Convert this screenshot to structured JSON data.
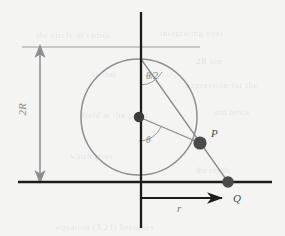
{
  "figure": {
    "background_color": "#f4f4f2",
    "stroke_dark": "#1c1c1c",
    "stroke_gray": "#8e8e92",
    "dot_fill": "#3b3b3b",
    "point_fill": "#4a4a4a"
  },
  "labels": {
    "diameter": "2R",
    "angle_half": "θ/2",
    "angle": "θ",
    "point_p": "P",
    "point_q": "Q",
    "distance_r": "r"
  },
  "geometry": {
    "canvas": {
      "width": 285,
      "height": 236
    },
    "vertical_axis": {
      "x": 141,
      "y1": 12,
      "y2": 228,
      "color": "#1c1c1c",
      "width": 2.2
    },
    "baseline": {
      "y": 182,
      "x1": 18,
      "x2": 272,
      "color": "#1c1c1c",
      "width": 2.2
    },
    "tangent_top": {
      "y": 47,
      "x1": 22,
      "x2": 200,
      "color": "#9a9a9e",
      "width": 1.1
    },
    "circle": {
      "cx": 139,
      "cy": 117,
      "r": 58,
      "color": "#8e8e92",
      "width": 1.4
    },
    "center_dot": {
      "cx": 139,
      "cy": 117,
      "r": 5.2
    },
    "point_p": {
      "cx": 200,
      "cy": 143,
      "r": 6.6
    },
    "point_q": {
      "cx": 228,
      "cy": 182,
      "r": 5.8
    },
    "circle_top": {
      "x": 141,
      "y": 59
    },
    "chord_top_to_q": {
      "x1": 141,
      "y1": 59,
      "x2": 228,
      "y2": 182
    },
    "radius_to_p": {
      "x1": 139,
      "y1": 117,
      "x2": 200,
      "y2": 143
    },
    "dimension_line": {
      "x": 40,
      "y_top": 47,
      "y_bottom": 182,
      "color": "#8e8e92"
    },
    "r_arrow": {
      "y": 198,
      "x1": 141,
      "x2": 226,
      "color": "#1c1c1c"
    },
    "angle_arc_half": {
      "cx": 141,
      "cy": 59,
      "r": 26,
      "from_deg": 90,
      "to_deg": 55
    },
    "angle_arc_theta": {
      "cx": 139,
      "cy": 117,
      "r": 24,
      "from_deg": 90,
      "to_deg": 23
    }
  },
  "label_positions": {
    "diameter": {
      "left": 18,
      "top": 106
    },
    "angle_half": {
      "left": 128,
      "top": 72
    },
    "angle": {
      "left": 144,
      "top": 134
    },
    "point_p": {
      "left": 210,
      "top": 128
    },
    "point_q": {
      "left": 232,
      "top": 193
    },
    "distance_r": {
      "left": 176,
      "top": 202
    }
  },
  "bleed_text": [
    {
      "text": "the circle of radius",
      "left": 36,
      "top": 30,
      "size": 9
    },
    {
      "text": "integrating over",
      "left": 160,
      "top": 28,
      "size": 9
    },
    {
      "text": "2R sin",
      "left": 196,
      "top": 56,
      "size": 9
    },
    {
      "text": "so that",
      "left": 92,
      "top": 70,
      "size": 8
    },
    {
      "text": "expression for the",
      "left": 186,
      "top": 80,
      "size": 9
    },
    {
      "text": "field at the point",
      "left": 82,
      "top": 110,
      "size": 9
    },
    {
      "text": "and hence",
      "left": 214,
      "top": 108,
      "size": 8
    },
    {
      "text": "which gives",
      "left": 70,
      "top": 152,
      "size": 8
    },
    {
      "text": "the result",
      "left": 196,
      "top": 166,
      "size": 8
    },
    {
      "text": "equation (3.21) becomes",
      "left": 56,
      "top": 222,
      "size": 9
    }
  ]
}
